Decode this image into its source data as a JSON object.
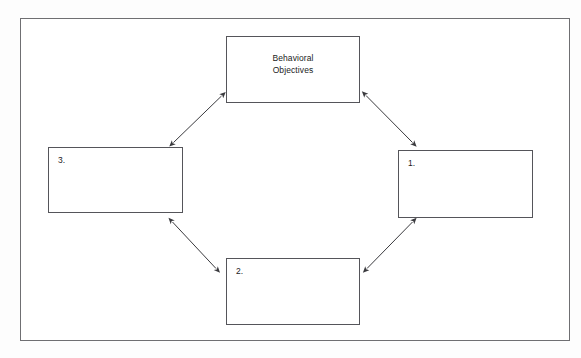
{
  "page": {
    "background_color": "#fdfdfd",
    "frame_border_color": "#6f6f72"
  },
  "diagram": {
    "type": "cycle",
    "box_border_color": "#55555a",
    "arrow_color": "#3a3a3e",
    "boxes": [
      {
        "id": "behavioral-objectives",
        "position": "top",
        "lines": [
          "Behavioral",
          "Objectives"
        ],
        "text_align": "center"
      },
      {
        "id": "step-1",
        "position": "right",
        "label": "1.",
        "lines": [],
        "text_align": "left"
      },
      {
        "id": "step-2",
        "position": "bottom",
        "label": "2.",
        "lines": [],
        "text_align": "left"
      },
      {
        "id": "step-3",
        "position": "left",
        "label": "3.",
        "lines": [],
        "text_align": "left"
      }
    ],
    "connectors": [
      {
        "id": "top-left-connector",
        "from": "behavioral-objectives",
        "to": "step-3",
        "style": "double-headed-arrow"
      },
      {
        "id": "top-right-connector",
        "from": "behavioral-objectives",
        "to": "step-1",
        "style": "double-headed-arrow"
      },
      {
        "id": "bottom-right-connector",
        "from": "step-1",
        "to": "step-2",
        "style": "double-headed-arrow"
      },
      {
        "id": "bottom-left-connector",
        "from": "step-2",
        "to": "step-3",
        "style": "double-headed-arrow"
      }
    ]
  }
}
